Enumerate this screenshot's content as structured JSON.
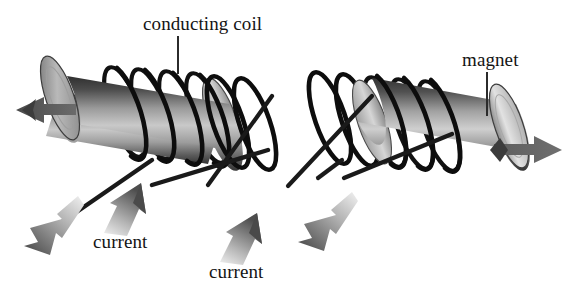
{
  "figure": {
    "background_color": "#ffffff",
    "width": 577,
    "height": 294
  },
  "labels": {
    "conducting_coil": "conducting coil",
    "magnet": "magnet",
    "current_left": "current",
    "current_right": "current"
  },
  "colors": {
    "text": "#141414",
    "coil_wire": "#111111",
    "leader_line": "#2b2b2b",
    "cylinder_dark": "#3a3a3a",
    "cylinder_mid": "#8e8e8e",
    "cylinder_light": "#d8d8d8",
    "cylinder_face": "#efefef",
    "motion_arrow": "#5a5a5a",
    "current_arrow_head": "#555555",
    "current_arrow_tail": "#e8e8e8"
  },
  "assemblies": [
    {
      "name": "left-assembly",
      "magnet_label_shown": false,
      "coil_turns": 6,
      "motion_arrow_direction": "left",
      "lead_wires": 2,
      "current_arrows": [
        "down-left",
        "up-right"
      ]
    },
    {
      "name": "right-assembly",
      "magnet_label_shown": true,
      "coil_turns": 6,
      "motion_arrow_direction": "right",
      "lead_wires": 2,
      "current_arrows": [
        "up-right",
        "down-left"
      ]
    }
  ],
  "icons": {
    "motion_arrow_left": "arrow-left-icon",
    "motion_arrow_right": "arrow-right-icon",
    "current_arrow_up": "arrow-up-right-icon",
    "current_arrow_down": "arrow-down-left-icon",
    "leader": "leader-line-icon"
  }
}
